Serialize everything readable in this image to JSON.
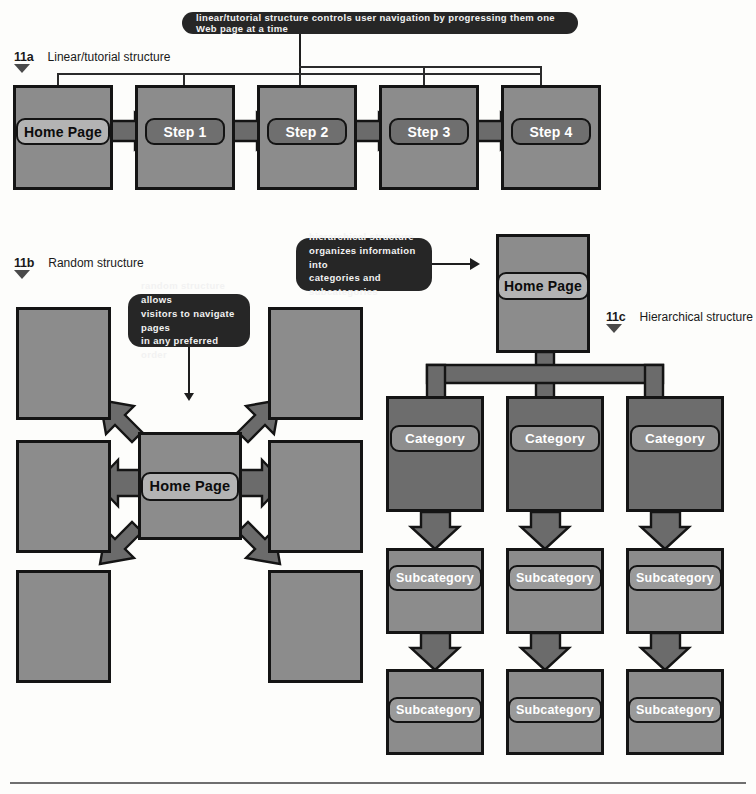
{
  "figure": {
    "panels": [
      {
        "num": "11a",
        "title": "Linear/tutorial structure"
      },
      {
        "num": "11b",
        "title": "Random structure"
      },
      {
        "num": "11c",
        "title": "Hierarchical structure"
      }
    ]
  },
  "callouts": {
    "linear": "linear/tutorial structure controls user navigation by progressing them one Web page at a time",
    "random_l1": "random structure allows",
    "random_l2": "visitors to navigate pages",
    "random_l3": "in any preferred order",
    "hier_l1": "hierarchical structure",
    "hier_l2": "organizes information into",
    "hier_l3": "categories and subcategories"
  },
  "linear": {
    "nodes": [
      {
        "label": "Home Page",
        "style": "light"
      },
      {
        "label": "Step 1",
        "style": "onstep"
      },
      {
        "label": "Step 2",
        "style": "onstep"
      },
      {
        "label": "Step 3",
        "style": "onstep"
      },
      {
        "label": "Step 4",
        "style": "onstep"
      }
    ]
  },
  "random": {
    "center": "Home Page",
    "satellites": [
      "",
      "",
      "",
      "",
      "",
      ""
    ]
  },
  "hierarchical": {
    "root": "Home Page",
    "categories": [
      "Category",
      "Category",
      "Category"
    ],
    "subcategories_row1": [
      "Subcategory",
      "Subcategory",
      "Subcategory"
    ],
    "subcategories_row2": [
      "Subcategory",
      "Subcategory",
      "Subcategory"
    ]
  },
  "colors": {
    "page_fill": "#8c8c8c",
    "page_fill_dark": "#6d6d6d",
    "outline": "#141414",
    "callout_bg": "#262626",
    "arrow_fill": "#6b6b6b"
  }
}
